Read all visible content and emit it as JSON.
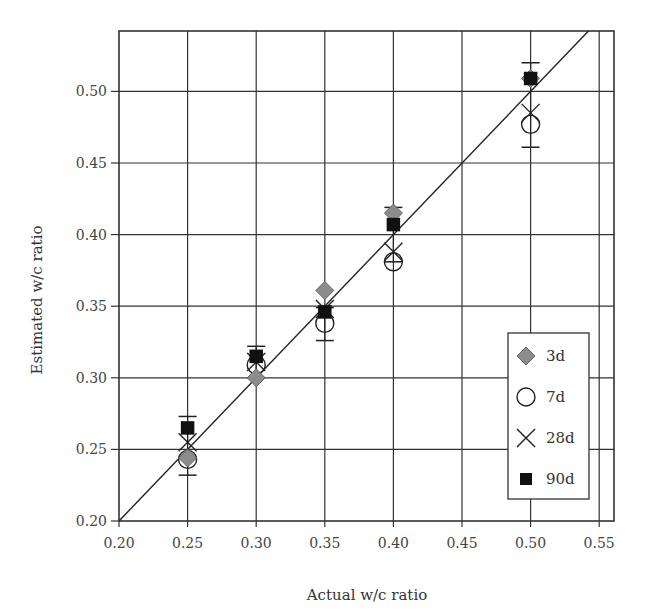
{
  "chart_data": {
    "type": "scatter",
    "title": "",
    "xlabel": "Actual w/c ratio",
    "ylabel": "Estimated w/c ratio",
    "xlim": [
      0.2,
      0.557
    ],
    "ylim": [
      0.2,
      0.541
    ],
    "x_ticks": [
      "0.20",
      "0.25",
      "0.30",
      "0.35",
      "0.40",
      "0.45",
      "0.50",
      "0.55"
    ],
    "y_ticks": [
      "0.20",
      "0.25",
      "0.30",
      "0.35",
      "0.40",
      "0.45",
      "0.50"
    ],
    "grid": true,
    "legend_position": "lower right",
    "reference_line": {
      "label": "1:1 line",
      "from": [
        0.2,
        0.2
      ],
      "to": [
        0.55,
        0.55
      ]
    },
    "x": [
      0.25,
      0.3,
      0.35,
      0.4,
      0.5
    ],
    "series": [
      {
        "name": "3d",
        "marker": "diamond",
        "color": "#8c8c8c",
        "values": [
          0.244,
          0.3,
          0.361,
          0.415,
          0.509
        ]
      },
      {
        "name": "7d",
        "marker": "circle",
        "color": "#ffffff",
        "values": [
          0.243,
          0.309,
          0.338,
          0.381,
          0.477
        ]
      },
      {
        "name": "28d",
        "marker": "x",
        "color": "#222222",
        "values": [
          0.255,
          0.311,
          0.348,
          0.388,
          0.485
        ]
      },
      {
        "name": "90d",
        "marker": "square",
        "color": "#111111",
        "values": [
          0.265,
          0.315,
          0.346,
          0.407,
          0.509
        ]
      }
    ],
    "error_bars": [
      {
        "x": 0.25,
        "low": 0.232,
        "high": 0.273
      },
      {
        "x": 0.3,
        "low": 0.3,
        "high": 0.322
      },
      {
        "x": 0.35,
        "low": 0.326,
        "high": 0.349
      },
      {
        "x": 0.4,
        "low": 0.381,
        "high": 0.419
      },
      {
        "x": 0.5,
        "low": 0.461,
        "high": 0.52
      }
    ]
  },
  "legend": {
    "items": [
      {
        "label": "3d",
        "marker": "diamond"
      },
      {
        "label": "7d",
        "marker": "circle"
      },
      {
        "label": "28d",
        "marker": "x"
      },
      {
        "label": "90d",
        "marker": "square"
      }
    ]
  },
  "axes": {
    "x_title": "Actual w/c ratio",
    "y_title": "Estimated w/c ratio"
  }
}
